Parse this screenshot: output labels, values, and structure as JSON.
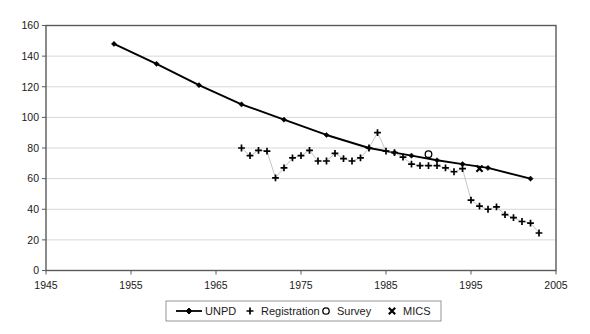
{
  "chart_data": {
    "type": "scatter",
    "title": "",
    "subtitle": "",
    "xlabel": "",
    "ylabel": "",
    "xlim": [
      1945,
      2005
    ],
    "ylim": [
      0,
      160
    ],
    "xticks": [
      1945,
      1955,
      1965,
      1975,
      1985,
      1995,
      2005
    ],
    "yticks": [
      0,
      20,
      40,
      60,
      80,
      100,
      120,
      140,
      160
    ],
    "xtick_labels": [
      "1945",
      "1955",
      "1965",
      "1975",
      "1985",
      "1995",
      "2005"
    ],
    "ytick_labels": [
      "0",
      "20",
      "40",
      "60",
      "80",
      "100",
      "120",
      "140",
      "160"
    ],
    "grid": "horizontal",
    "legend_position": "bottom",
    "series": [
      {
        "name": "UNPD",
        "marker": "diamond",
        "style": "line-with-markers",
        "color": "#000000",
        "x": [
          1953,
          1958,
          1963,
          1968,
          1973,
          1978,
          1983,
          1986,
          1988,
          1991,
          1994,
          1997,
          2002
        ],
        "values": [
          148,
          135,
          121,
          108.5,
          98.5,
          88.5,
          80,
          77,
          75,
          72,
          69.5,
          67,
          60
        ]
      },
      {
        "name": "Registration",
        "marker": "plus",
        "style": "markers-with-thin-line",
        "color": "#000000",
        "x": [
          1968,
          1969,
          1970,
          1971,
          1972,
          1973,
          1974,
          1975,
          1976,
          1977,
          1978,
          1979,
          1980,
          1981,
          1982,
          1983,
          1984,
          1985,
          1986,
          1987,
          1988,
          1989,
          1990,
          1991,
          1992,
          1993,
          1994,
          1995,
          1996,
          1997,
          1998,
          1999,
          2000,
          2001,
          2002,
          2003
        ],
        "values": [
          80,
          75,
          78.5,
          78,
          60.5,
          67,
          73.5,
          75,
          78.5,
          71.5,
          71.5,
          76.5,
          73,
          71.5,
          73.5,
          80,
          90,
          78,
          77,
          74,
          69.5,
          68.5,
          68.5,
          68.5,
          67,
          64.5,
          66.5,
          46,
          42,
          40,
          41.5,
          36.5,
          34.5,
          32,
          31,
          24.5
        ]
      },
      {
        "name": "Survey",
        "marker": "circle",
        "style": "markers-only",
        "color": "#000000",
        "x": [
          1990
        ],
        "values": [
          76
        ]
      },
      {
        "name": "MICS",
        "marker": "x",
        "style": "markers-only",
        "color": "#000000",
        "x": [
          1996
        ],
        "values": [
          66.5
        ]
      }
    ]
  },
  "legend": {
    "items": [
      {
        "label": "UNPD",
        "marker": "line-diamond"
      },
      {
        "label": "Registration",
        "marker": "plus"
      },
      {
        "label": "Survey",
        "marker": "circle"
      },
      {
        "label": "MICS",
        "marker": "x"
      }
    ]
  },
  "colors": {
    "axis": "#5a5a5a",
    "grid": "#d8d8d8",
    "series": "#000000",
    "background": "#ffffff",
    "thin_connector": "#b9b9b9"
  }
}
